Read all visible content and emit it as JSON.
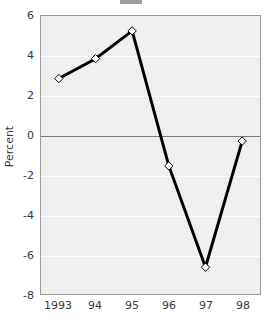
{
  "chart_data": {
    "type": "line",
    "title": "",
    "xlabel": "",
    "ylabel": "Percent",
    "categories": [
      "1993",
      "94",
      "95",
      "96",
      "97",
      "98"
    ],
    "values": [
      2.85,
      3.85,
      5.25,
      -1.55,
      -6.65,
      -0.3
    ],
    "series": [
      {
        "name": "Percent change",
        "values": [
          2.85,
          3.85,
          5.25,
          -1.55,
          -6.65,
          -0.3
        ]
      }
    ],
    "ylim": [
      -8,
      6
    ],
    "yticks": [
      6,
      4,
      2,
      0,
      -2,
      -4,
      -6,
      -8
    ],
    "ytick_labels": [
      "6",
      "4",
      "2",
      "0",
      "-2",
      "-4",
      "-6",
      "-8"
    ],
    "xtick_labels": [
      "1993",
      "94",
      "95",
      "96",
      "97",
      "98"
    ],
    "grid": true,
    "gridlines_color": "#ffffff",
    "zero_reference_line": true,
    "zero_line_color": "#7a7a7a",
    "legend": false,
    "legend_position": "none",
    "plot_background": "#efefef",
    "line_color": "#000000",
    "line_width": 3,
    "marker": "diamond",
    "marker_face_color": "#ffffff",
    "marker_edge_color": "#000000",
    "annotations": []
  }
}
